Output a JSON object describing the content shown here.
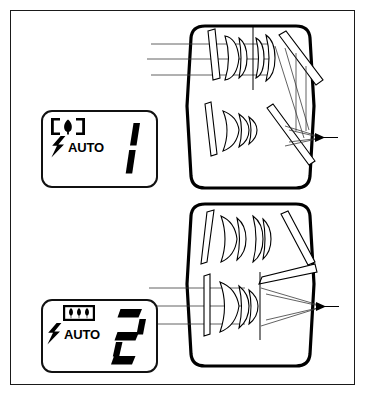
{
  "figure": {
    "border_color": "#1a1a1a",
    "background_color": "#ffffff",
    "ink_color": "#000000"
  },
  "panels": [
    {
      "id": "panel-1",
      "mode_icon_name": "single-tree-bracket-icon",
      "mode_icon_description": "single tree between two bracket marks",
      "flash_icon_name": "lightning-bolt-icon",
      "flash_label": "AUTO",
      "digit_value": "1",
      "digit_style": "lcd-seven-segment"
    },
    {
      "id": "panel-2",
      "mode_icon_name": "three-trees-box-icon",
      "mode_icon_description": "three trees inside a rectangular box",
      "flash_icon_name": "lightning-bolt-icon",
      "flash_label": "AUTO",
      "digit_value": "2",
      "digit_style": "lcd-seven-segment"
    }
  ],
  "diagrams": [
    {
      "id": "diagram-1",
      "name": "optical-path-wide",
      "description": "Viewfinder optical path, wide setting: incoming parallel rays pass lens groups, fold through two mirrors and converge to eyepoint",
      "ray_count": 3,
      "ray_direction": "left-to-right",
      "convergence_marker": "arrow-point"
    },
    {
      "id": "diagram-2",
      "name": "optical-path-tele",
      "description": "Viewfinder optical path, tele setting: lens groups moved, rays enter lower path and converge steeply to eyepoint",
      "ray_count": 3,
      "ray_direction": "left-to-right",
      "convergence_marker": "arrow-point"
    }
  ]
}
